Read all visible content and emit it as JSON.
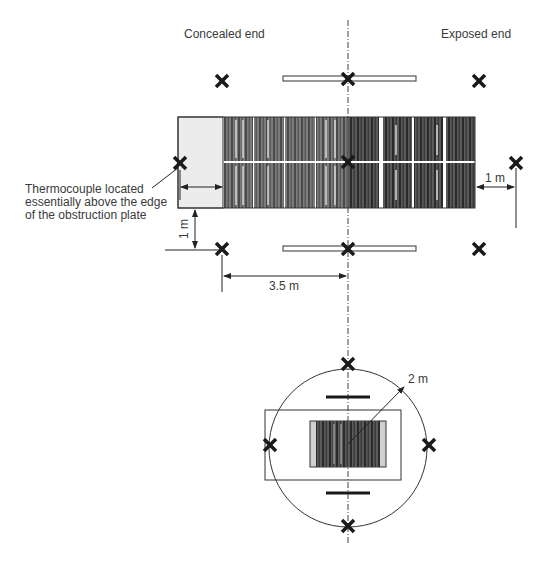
{
  "diagram": {
    "plan_view": {
      "labels": {
        "concealed_end": "Concealed end",
        "exposed_end": "Exposed end",
        "thermocouple_note": "Thermocouple located essentially above the edge of the obstruction plate",
        "dim_1m_left": "1 m",
        "dim_1m_right": "1 m",
        "dim_3_5m": "3.5 m"
      },
      "thermocouples": 9,
      "obstruction_plates": 2,
      "rack_bays": 8
    },
    "end_view": {
      "labels": {
        "radius": "2 m"
      },
      "thermocouples": 4,
      "obstruction_bars": 2
    },
    "caption": "Figure ... Thermocouple locations in test arrangement"
  },
  "colors": {
    "ink": "#222222",
    "rack_dark": "#3a3a3a",
    "rack_mid": "#7a7a7a",
    "plate_fill": "#eeeeee",
    "text": "#3a3a3a"
  }
}
